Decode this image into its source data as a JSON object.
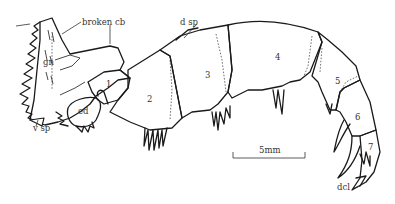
{
  "figure": {
    "labels": {
      "broken_cb": "broken cb",
      "d_sp": "d sp",
      "gn": "gn",
      "ed": "ed",
      "v_sp": "v sp",
      "dcl": "dcl"
    },
    "segments": [
      "1",
      "2",
      "3",
      "4",
      "5",
      "6",
      "7"
    ],
    "scale_bar": {
      "label": "5mm"
    },
    "colors": {
      "stroke": "#1a1a1a",
      "background": "#ffffff",
      "text": "#333333"
    }
  }
}
